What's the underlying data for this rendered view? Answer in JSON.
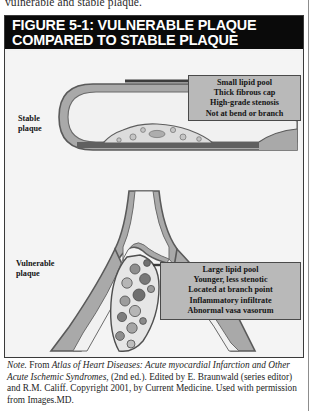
{
  "page": {
    "partial_line_above": "vulnerable and stable plaque."
  },
  "figure": {
    "title_line1": "FIGURE 5-1: VULNERABLE PLAQUE",
    "title_line2": "COMPARED TO STABLE PLAQUE",
    "labels": {
      "stable_line1": "Stable",
      "stable_line2": "plaque",
      "vulnerable_line1": "Vulnerable",
      "vulnerable_line2": "plaque"
    },
    "callout_stable": [
      "Small lipid pool",
      "Thick fibrous cap",
      "High-grade stenosis",
      "Not at bend or branch"
    ],
    "callout_vulnerable": [
      "Large lipid pool",
      "Younger, less stenotic",
      "Located at branch point",
      "Inflammatory infiltrate",
      "Abnormal vasa vasorum"
    ],
    "colors": {
      "title_bar": "#0a0a0a",
      "panel_background": "#f4f4f4",
      "callout_fill": "#b9b9b9",
      "vessel_wall": "#a8a8a8",
      "vessel_outline": "#555555",
      "plaque_fill": "#d8d8d8",
      "lipid_core": "#8a8a8a"
    }
  },
  "note": {
    "label": "Note.",
    "text_1": " From ",
    "italic_1": "Atlas of Heart Diseases: Acute myocardial Infarction and Other Acute Ischemic Syndromes",
    "text_2": ", (2nd ed.). Edited by E. Braunwald (series editor) and R.M. Califf. Copyright 2001, by Current Medicine. Used with permission from Images.MD."
  }
}
